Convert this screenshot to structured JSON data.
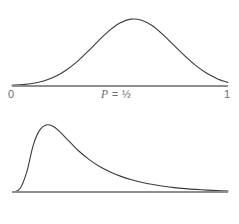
{
  "figure": {
    "background_color": "#ffffff",
    "curve_color": "#3a3a3a",
    "axis_color": "#8e8e8e",
    "label_color": "#6d6d6d"
  },
  "panels": [
    {
      "name": "top",
      "center_label_variable": "P",
      "center_label_equals": "=",
      "center_label_value": "½",
      "axis_start_label": "0",
      "axis_end_label": "1"
    },
    {
      "name": "bottom",
      "center_label_variable": "P",
      "center_label_equals": "=",
      "center_label_value": "0",
      "axis_start_label": "0",
      "axis_end_label": "1"
    }
  ],
  "chart_data": [
    {
      "type": "line",
      "title": "",
      "subtitle": "",
      "xlabel": "P = ½",
      "ylabel": "",
      "xlim": [
        0,
        1
      ],
      "ylim": [
        0,
        1
      ],
      "grid": false,
      "legend": "none",
      "annotations": [
        "P = ½"
      ],
      "xtick_labels": [
        "0",
        "1"
      ],
      "xticks": [
        0,
        1
      ],
      "ytick_labels": [],
      "distribution": "symmetric-bell",
      "peak_x": 0.5,
      "peak_y": 1.0,
      "x": [
        0.0,
        0.05,
        0.1,
        0.15,
        0.2,
        0.25,
        0.3,
        0.35,
        0.4,
        0.45,
        0.5,
        0.55,
        0.6,
        0.65,
        0.7,
        0.75,
        0.8,
        0.85,
        0.9,
        0.95,
        1.0
      ],
      "y": [
        0.01,
        0.02,
        0.04,
        0.075,
        0.135,
        0.225,
        0.345,
        0.49,
        0.645,
        0.79,
        0.9,
        0.955,
        0.94,
        0.86,
        0.73,
        0.58,
        0.43,
        0.295,
        0.185,
        0.105,
        0.05
      ]
    },
    {
      "type": "line",
      "title": "",
      "subtitle": "",
      "xlabel": "P = 0",
      "ylabel": "",
      "xlim": [
        0,
        1
      ],
      "ylim": [
        0,
        1
      ],
      "grid": false,
      "legend": "none",
      "annotations": [
        "P = 0"
      ],
      "xtick_labels": [
        "0",
        "1"
      ],
      "xticks": [
        0,
        1
      ],
      "ytick_labels": [],
      "distribution": "right-skewed",
      "peak_x": 0.17,
      "peak_y": 1.0,
      "x": [
        0.0,
        0.03,
        0.06,
        0.09,
        0.12,
        0.15,
        0.18,
        0.21,
        0.25,
        0.3,
        0.35,
        0.4,
        0.45,
        0.5,
        0.55,
        0.6,
        0.65,
        0.7,
        0.75,
        0.8,
        0.85,
        0.9,
        0.95,
        1.0
      ],
      "y": [
        0.0,
        0.06,
        0.3,
        0.69,
        0.91,
        0.985,
        0.97,
        0.9,
        0.77,
        0.61,
        0.48,
        0.375,
        0.295,
        0.23,
        0.18,
        0.14,
        0.11,
        0.085,
        0.065,
        0.05,
        0.038,
        0.028,
        0.02,
        0.014
      ]
    }
  ]
}
